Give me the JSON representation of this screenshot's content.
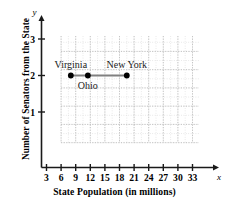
{
  "chart_data": {
    "type": "scatter",
    "title": "",
    "xlabel": "State Population (in millions)",
    "ylabel": "Number of Senators from the State",
    "x_axis_variable": "x",
    "y_axis_variable": "y",
    "xlim": [
      0,
      34.5
    ],
    "ylim": [
      0,
      3.4
    ],
    "xticks": [
      3,
      6,
      9,
      12,
      15,
      18,
      21,
      24,
      27,
      30,
      33
    ],
    "yticks": [
      1,
      2,
      3
    ],
    "grid": true,
    "grid_style": "dotted",
    "legend": "none",
    "series": [
      {
        "name": "States",
        "connected": true,
        "line_color": "#808080",
        "point_color": "#000000",
        "points": [
          {
            "label": "Virginia",
            "x": 8,
            "y": 2,
            "label_position": "above"
          },
          {
            "label": "Ohio",
            "x": 11.5,
            "y": 2,
            "label_position": "below"
          },
          {
            "label": "New York",
            "x": 19.5,
            "y": 2,
            "label_position": "above"
          }
        ]
      }
    ]
  },
  "colors": {
    "axis": "#1a1a1a",
    "grid_major": "#b8b8b8",
    "grid_minor": "#d8d8d8",
    "point": "#000000",
    "line": "#808080",
    "text": "#000000"
  }
}
